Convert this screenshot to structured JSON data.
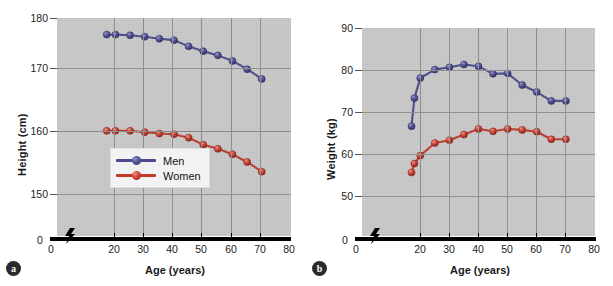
{
  "figure": {
    "panels": [
      {
        "id": "a",
        "badge_label": "a",
        "xlabel": "Age (years)",
        "ylabel": "Height (cm)",
        "zero_tick": "0",
        "x_zero_label": "0",
        "yticks": [
          "180",
          "170",
          "160",
          "150"
        ],
        "xticks": [
          "20",
          "30",
          "40",
          "50",
          "60",
          "70",
          "80"
        ],
        "legend": [
          {
            "label": "Men",
            "color": "#4b4a8a"
          },
          {
            "label": "Women",
            "color": "#c0392b"
          }
        ]
      },
      {
        "id": "b",
        "badge_label": "b",
        "xlabel": "Age (years)",
        "ylabel": "Weight (kg)",
        "zero_tick": "0",
        "x_zero_label": "0",
        "yticks": [
          "90",
          "80",
          "70",
          "60",
          "50"
        ],
        "xticks": [
          "20",
          "30",
          "40",
          "50",
          "60",
          "70",
          "80"
        ],
        "legend": []
      }
    ]
  },
  "chart_data": [
    {
      "type": "line",
      "panel": "a",
      "title": "",
      "xlabel": "Age (years)",
      "ylabel": "Height (cm)",
      "xlim": [
        0,
        80
      ],
      "ylim": [
        148.5,
        180
      ],
      "yticks": [
        150,
        160,
        170,
        180
      ],
      "xticks": [
        0,
        20,
        30,
        40,
        50,
        60,
        70,
        80
      ],
      "grid": true,
      "axis_break_x": true,
      "axis_break_y": true,
      "legend_position": "center-left-inside",
      "x": [
        17,
        20,
        25,
        30,
        35,
        40,
        45,
        50,
        55,
        60,
        65,
        70
      ],
      "series": [
        {
          "name": "Men",
          "color": "#4b4a8a",
          "values": [
            177.6,
            177.6,
            177.5,
            177.3,
            177.0,
            176.8,
            175.9,
            175.2,
            174.6,
            173.8,
            172.6,
            171.2
          ]
        },
        {
          "name": "Women",
          "color": "#c0392b",
          "values": [
            163.7,
            163.7,
            163.7,
            163.5,
            163.3,
            163.2,
            162.7,
            161.7,
            161.1,
            160.3,
            159.2,
            157.8
          ]
        }
      ]
    },
    {
      "type": "line",
      "panel": "b",
      "title": "",
      "xlabel": "Age (years)",
      "ylabel": "Weight (kg)",
      "xlim": [
        0,
        80
      ],
      "ylim": [
        45.5,
        90
      ],
      "yticks": [
        50,
        60,
        70,
        80,
        90
      ],
      "xticks": [
        0,
        20,
        30,
        40,
        50,
        60,
        70,
        80
      ],
      "grid": true,
      "axis_break_x": true,
      "axis_break_y": true,
      "legend_position": "none",
      "x": [
        17,
        18,
        20,
        25,
        30,
        35,
        40,
        45,
        50,
        55,
        60,
        65,
        70
      ],
      "series": [
        {
          "name": "Men",
          "color": "#4b4a8a",
          "values": [
            69.0,
            75.0,
            79.3,
            81.1,
            81.6,
            82.2,
            81.8,
            80.2,
            80.3,
            77.8,
            76.3,
            74.4,
            74.4
          ]
        },
        {
          "name": "Women",
          "color": "#c0392b",
          "values": [
            59.1,
            61.0,
            62.7,
            65.4,
            66.0,
            67.2,
            68.4,
            67.9,
            68.4,
            68.2,
            67.8,
            66.2,
            66.2
          ]
        }
      ]
    }
  ]
}
